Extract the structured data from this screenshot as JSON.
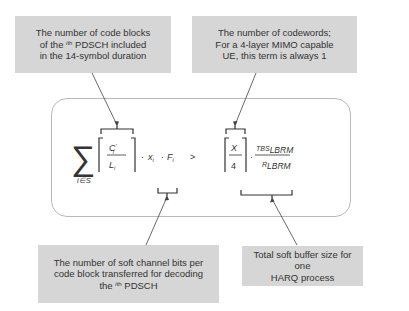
{
  "annotations": {
    "top_left": {
      "line1": "The number of code blocks",
      "line2_pre": "of the ",
      "line2_sup": "i",
      "line2_sup_suffix": "th",
      "line2_post": " PDSCH included",
      "line3": "in the 14-symbol duration"
    },
    "top_right": {
      "line1": "The number of codewords;",
      "line2": "For a 4-layer MIMO capable",
      "line3": "UE, this term is always 1"
    },
    "bottom_left": {
      "line1": "The number of soft channel bits per",
      "line2": "code block transferred for decoding",
      "line3_pre": "the ",
      "line3_sup": "i",
      "line3_sup_suffix": "th",
      "line3_post": " PDSCH"
    },
    "bottom_right": {
      "line1": "Total soft buffer size for one",
      "line2": "HARQ process"
    }
  },
  "formula": {
    "sum_symbol": "∑",
    "sum_subscript": "i∈S",
    "frac1_num": "C",
    "frac1_num_prime": "′",
    "frac1_num_sub": "i",
    "frac1_den": "L",
    "frac1_den_sub": "i",
    "dot1": "·",
    "x_var": "x",
    "x_sub": "i",
    "dot2": "·",
    "f_var": "F",
    "f_sub": "i",
    "comparator": ">",
    "frac2_num": "X",
    "frac2_den": "4",
    "dot3": "·",
    "frac3_num_main": "TBS",
    "frac3_num_sub": "LBRM",
    "frac3_den_main": "R",
    "frac3_den_sub": "LBRM"
  },
  "colors": {
    "note_bg": "#d6d6d6",
    "frame_border": "#b9b9b9",
    "line": "#444444"
  }
}
